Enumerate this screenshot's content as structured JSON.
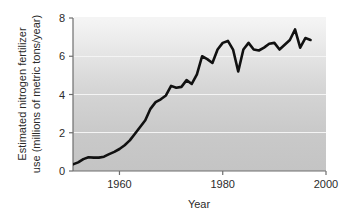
{
  "chart_data": {
    "type": "line",
    "title": "",
    "xlabel": "Year",
    "ylabel": "Estimated nitrogen fertilizer use (millions of metric tons/year)",
    "ylabel_line1": "Estimated nitrogen fertilizer",
    "ylabel_line2": "use (millions of metric tons/year)",
    "xlim": [
      1951,
      2000
    ],
    "ylim": [
      0,
      8
    ],
    "xticks": [
      1960,
      1980,
      2000
    ],
    "xticklabels": [
      "1960",
      "1980",
      "2000"
    ],
    "yticks": [
      0,
      2,
      4,
      6,
      8
    ],
    "yticklabels": [
      "0",
      "2",
      "4",
      "6",
      "8"
    ],
    "grid": "horizontal-white-gridlines",
    "legend": "none",
    "line_color": "#111111",
    "line_width": 2.6,
    "plot_background": "vertical gradient light gray (#f2f2f2) to mid gray (#c6c6c6)",
    "series": [
      {
        "name": "Estimated nitrogen fertilizer use",
        "x": [
          1951,
          1952,
          1953,
          1954,
          1955,
          1956,
          1957,
          1958,
          1959,
          1960,
          1961,
          1962,
          1963,
          1964,
          1965,
          1966,
          1967,
          1968,
          1969,
          1970,
          1971,
          1972,
          1973,
          1974,
          1975,
          1976,
          1977,
          1978,
          1979,
          1980,
          1981,
          1982,
          1983,
          1984,
          1985,
          1986,
          1987,
          1988,
          1989,
          1990,
          1991,
          1992,
          1993,
          1994,
          1995,
          1996,
          1997
        ],
        "y": [
          0.35,
          0.45,
          0.62,
          0.72,
          0.7,
          0.7,
          0.75,
          0.88,
          1.0,
          1.15,
          1.35,
          1.6,
          1.95,
          2.3,
          2.65,
          3.25,
          3.6,
          3.75,
          3.95,
          4.45,
          4.35,
          4.4,
          4.75,
          4.55,
          5.05,
          6.0,
          5.85,
          5.65,
          6.35,
          6.7,
          6.8,
          6.35,
          5.2,
          6.35,
          6.7,
          6.35,
          6.3,
          6.45,
          6.65,
          6.7,
          6.35,
          6.6,
          6.85,
          7.4,
          6.45,
          6.95,
          6.85
        ]
      }
    ]
  },
  "axis": {
    "x_label": "Year",
    "y_label_line1": "Estimated nitrogen fertilizer",
    "y_label_line2": "use (millions of metric tons/year)"
  }
}
